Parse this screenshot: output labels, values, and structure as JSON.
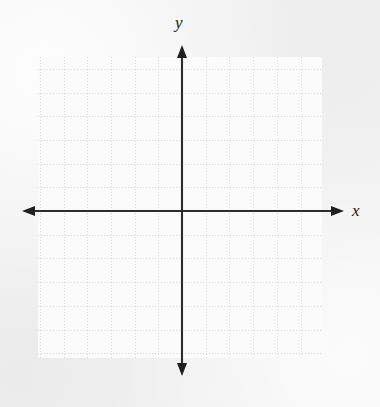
{
  "figure": {
    "kind": "cartesian-coordinate-plane",
    "width": 380,
    "height": 407,
    "background_color": "#f2f2f2",
    "panel_color": "#fbfbfb"
  },
  "axes": {
    "x_label": "x",
    "y_label": "y",
    "axis_color": "#2b2b2b",
    "axis_line_width": 2,
    "arrowheads": [
      "left",
      "right",
      "up",
      "down"
    ],
    "origin": {
      "x": 182,
      "y": 211
    },
    "x_axis": {
      "y": 211,
      "start_x": 22,
      "end_x": 344
    },
    "y_axis": {
      "x": 182,
      "start_y": 45,
      "end_y": 376
    },
    "tick_labels_visible": false,
    "tick_marks_visible": false
  },
  "grid": {
    "color": "#cfcfcf",
    "style": "dotted",
    "cell_size": 23.7,
    "left": 38,
    "top": 57,
    "right": 322,
    "bottom": 358,
    "columns": 12,
    "rows": 13,
    "vertical_line_count": 13,
    "horizontal_line_count": 14
  },
  "chart_data": {
    "type": "scatter",
    "title": "",
    "xlabel": "x",
    "ylabel": "y",
    "x": [],
    "y": [],
    "series": [],
    "xlim": [
      -6,
      6
    ],
    "ylim": [
      -6.2,
      6.5
    ],
    "grid": true,
    "legend": "none",
    "annotations": [],
    "note": "Empty coordinate grid: blank graph paper with labeled x and y axes, no plotted data points."
  }
}
